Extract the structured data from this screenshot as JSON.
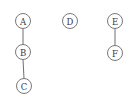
{
  "diagram": {
    "type": "graph",
    "style": {
      "node_stroke": "#6a6a6a",
      "edge_color": "#6e6e6e",
      "label_color": "#3a3a3a",
      "background": "#ffffff"
    },
    "nodes": [
      {
        "id": "A",
        "label": "A",
        "x": 23,
        "y": 21,
        "r": 7.5
      },
      {
        "id": "B",
        "label": "B",
        "x": 23,
        "y": 52,
        "r": 7.5
      },
      {
        "id": "C",
        "label": "C",
        "x": 24,
        "y": 86,
        "r": 7.5
      },
      {
        "id": "D",
        "label": "D",
        "x": 70,
        "y": 21,
        "r": 7.5
      },
      {
        "id": "E",
        "label": "E",
        "x": 115,
        "y": 21,
        "r": 7.5
      },
      {
        "id": "F",
        "label": "F",
        "x": 115,
        "y": 53,
        "r": 7.5
      }
    ],
    "edges": [
      {
        "from": "A",
        "to": "B"
      },
      {
        "from": "B",
        "to": "C"
      },
      {
        "from": "E",
        "to": "F"
      }
    ]
  }
}
